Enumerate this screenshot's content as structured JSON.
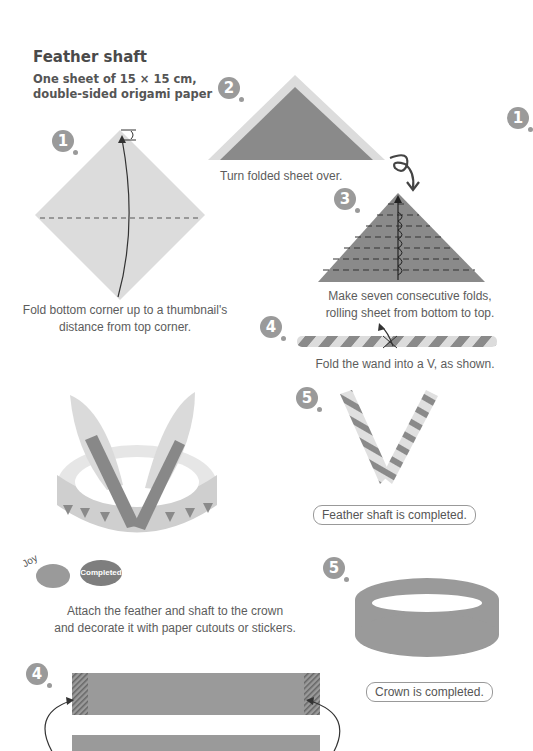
{
  "header": {
    "title": "Feather shaft",
    "subtitle_line1": "One sheet of 15 × 15 cm,",
    "subtitle_line2": "double-sided origami paper"
  },
  "steps": {
    "feather_shaft": [
      {
        "number": "1",
        "caption_line1": "Fold bottom corner up to a thumbnail's",
        "caption_line2": "distance from top corner."
      },
      {
        "number": "2",
        "caption": "Turn folded sheet over."
      },
      {
        "number": "3",
        "caption_line1": "Make seven consecutive folds,",
        "caption_line2": "rolling sheet from bottom to top."
      },
      {
        "number": "4",
        "caption": "Fold the wand into a V, as shown."
      },
      {
        "number": "5",
        "completion": "Feather shaft is completed."
      }
    ],
    "crown": [
      {
        "number": "4"
      },
      {
        "number": "5",
        "completion": "Crown is completed."
      }
    ],
    "right_edge_badge": "1"
  },
  "final": {
    "sticker_text": "Joy",
    "bubble_text": "Completed",
    "caption_line1": "Attach the feather and shaft to the crown",
    "caption_line2": "and decorate it with paper cutouts or stickers."
  },
  "colors": {
    "paper_light": "#dcdcdc",
    "paper_dark": "#8a8a8a",
    "badge": "#9a9a9a",
    "text": "#5c5c5c"
  }
}
